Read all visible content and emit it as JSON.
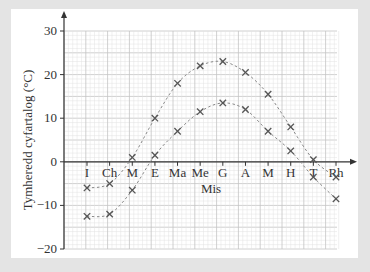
{
  "chart_data": {
    "type": "line",
    "title": "",
    "xlabel": "Mis",
    "ylabel": "Tymheredd cyfartalog (°C)",
    "ylim": [
      -20,
      30
    ],
    "yticks": [
      30,
      20,
      10,
      0,
      -10,
      -20
    ],
    "grid": true,
    "legend": null,
    "categories": [
      "I",
      "Ch",
      "M",
      "E",
      "Ma",
      "Me",
      "G",
      "A",
      "M",
      "H",
      "T",
      "Rh"
    ],
    "series": [
      {
        "name": "upper",
        "values": [
          -6,
          -5,
          1,
          10,
          18,
          22,
          23,
          20.5,
          15.5,
          8,
          0.5,
          -3.5
        ]
      },
      {
        "name": "lower",
        "values": [
          -12.5,
          -12,
          -6.5,
          1.5,
          7,
          11.5,
          13.5,
          12,
          7,
          2.5,
          -3.5,
          -8.5
        ]
      }
    ],
    "marker": "x",
    "line_style": "dashed"
  },
  "colors": {
    "background": "#e4e4e4",
    "card": "#ffffff",
    "grid_minor": "#e2e2e2",
    "grid_major": "#c4c4c4",
    "axis": "#333333",
    "series": "#888888",
    "marker": "#555555"
  }
}
